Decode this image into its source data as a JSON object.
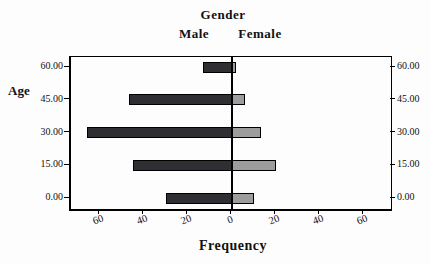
{
  "header": {
    "title": "Gender",
    "male_label": "Male",
    "female_label": "Female"
  },
  "axes": {
    "y_label": "Age",
    "x_label": "Frequency",
    "y_tick_labels": [
      "0.00",
      "15.00",
      "30.00",
      "45.00",
      "60.00"
    ],
    "x_tick_labels": [
      "60",
      "40",
      "20",
      "0",
      "20",
      "40",
      "60"
    ]
  },
  "colors": {
    "male_bar": "#2e2e33",
    "female_bar": "#9c9c9c",
    "bar_border": "#000000",
    "axis": "#000000",
    "background": "#fdfdfd"
  },
  "chart_data": {
    "type": "bar",
    "subtype": "population-pyramid",
    "title": "Gender",
    "xlabel": "Frequency",
    "ylabel": "Age",
    "categories": [
      0,
      15,
      30,
      45,
      60
    ],
    "category_labels": [
      "0.00",
      "15.00",
      "30.00",
      "45.00",
      "60.00"
    ],
    "series": [
      {
        "name": "Male",
        "side": "left",
        "values": [
          30,
          45,
          66,
          47,
          13
        ]
      },
      {
        "name": "Female",
        "side": "right",
        "values": [
          10,
          20,
          13,
          6,
          2
        ]
      }
    ],
    "x_tick_values": [
      60,
      40,
      20,
      0,
      20,
      40,
      60
    ],
    "xlim_each_side": [
      0,
      75
    ],
    "grid": false,
    "legend_position": "top"
  }
}
